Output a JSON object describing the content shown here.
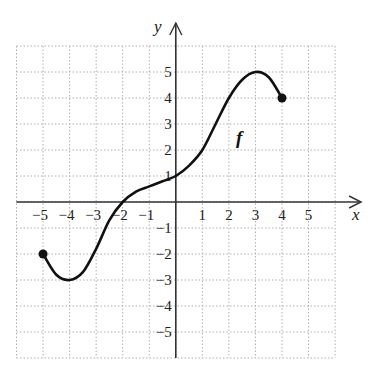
{
  "chart_data": {
    "type": "line",
    "title": "",
    "xlabel": "x",
    "ylabel": "y",
    "function_label": "f",
    "xlim": [
      -6,
      6
    ],
    "ylim": [
      -6,
      6
    ],
    "grid": true,
    "grid_style": "dotted",
    "x_ticks": [
      -5,
      -4,
      -3,
      -2,
      -1,
      1,
      2,
      3,
      4,
      5
    ],
    "y_ticks": [
      -5,
      -4,
      -3,
      -2,
      -1,
      1,
      2,
      3,
      4,
      5
    ],
    "x_tick_labels": [
      "−5",
      "−4",
      "−3",
      "−2",
      "−1",
      "1",
      "2",
      "3",
      "4",
      "5"
    ],
    "y_tick_labels": [
      "−5",
      "−4",
      "−3",
      "−2",
      "−1",
      "1",
      "2",
      "3",
      "4",
      "5"
    ],
    "series": [
      {
        "name": "f",
        "points": [
          [
            -5,
            -2
          ],
          [
            -4.5,
            -2.8
          ],
          [
            -4,
            -3
          ],
          [
            -3.5,
            -2.7
          ],
          [
            -3,
            -1.8
          ],
          [
            -2.5,
            -0.7
          ],
          [
            -2,
            0
          ],
          [
            -1.5,
            0.4
          ],
          [
            -1,
            0.6
          ],
          [
            -0.5,
            0.8
          ],
          [
            0,
            1
          ],
          [
            0.5,
            1.4
          ],
          [
            1,
            2
          ],
          [
            1.5,
            3
          ],
          [
            2,
            4
          ],
          [
            2.5,
            4.7
          ],
          [
            3,
            5
          ],
          [
            3.5,
            4.8
          ],
          [
            4,
            4
          ]
        ],
        "endpoints": [
          [
            -5,
            -2
          ],
          [
            4,
            4
          ]
        ],
        "endpoint_style": "closed"
      }
    ],
    "key_points": {
      "start": [
        -5,
        -2
      ],
      "local_min": [
        -4,
        -3
      ],
      "x_intercept": [
        -2,
        0
      ],
      "y_intercept": [
        0,
        1
      ],
      "local_max": [
        3,
        5
      ],
      "end": [
        4,
        4
      ]
    }
  },
  "colors": {
    "axis": "#333333",
    "grid": "#b0b0b0",
    "curve": "#111111",
    "background": "#ffffff"
  }
}
